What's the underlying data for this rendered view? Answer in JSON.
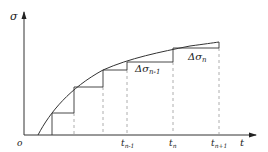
{
  "diagram": {
    "y_axis_label": "σ",
    "x_axis_label": "t",
    "origin_label": "o",
    "ticks": [
      {
        "base": "t",
        "sub": "n-1"
      },
      {
        "base": "t",
        "sub": "n"
      },
      {
        "base": "t",
        "sub": "n+1"
      }
    ],
    "increments": [
      {
        "base": "Δσ",
        "sub": "n-1"
      },
      {
        "base": "Δσ",
        "sub": "n"
      }
    ],
    "colors": {
      "line": "#333333",
      "dashed": "#999999"
    }
  }
}
